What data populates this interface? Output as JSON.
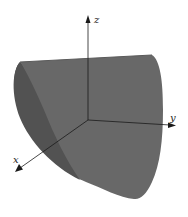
{
  "figure": {
    "colors": {
      "background": "#ffffff",
      "surface_front": "#6a6a6a",
      "surface_back": "#4e4e4e",
      "surface_edge": "#3a3a3a",
      "axis": "#1a1a1a"
    },
    "axes": {
      "x": {
        "label": "x"
      },
      "y": {
        "label": "y"
      },
      "z": {
        "label": "z"
      }
    }
  }
}
